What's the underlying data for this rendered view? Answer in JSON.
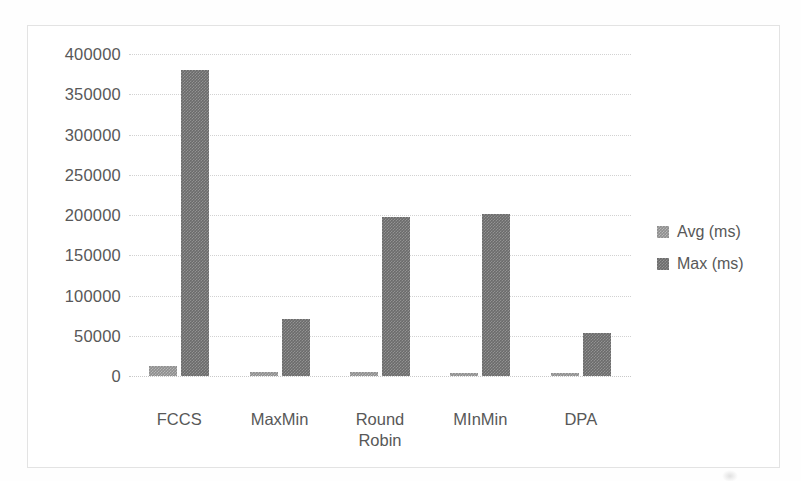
{
  "chart_data": {
    "type": "bar",
    "title": "",
    "xlabel": "",
    "ylabel": "",
    "categories": [
      "FCCS",
      "MaxMin",
      "Round\nRobin",
      "MInMin",
      "DPA"
    ],
    "series": [
      {
        "name": "Avg (ms)",
        "color": "#8e8e8e",
        "values": [
          13000,
          4500,
          5000,
          4000,
          4000
        ]
      },
      {
        "name": "Max (ms)",
        "color": "#6b6b6b",
        "values": [
          380000,
          71000,
          198000,
          201000,
          53000
        ]
      }
    ],
    "ylim": [
      0,
      400000
    ],
    "ytick_labels": [
      "400000",
      "350000",
      "300000",
      "250000",
      "200000",
      "150000",
      "100000",
      "50000",
      "0"
    ],
    "ytick_values": [
      400000,
      350000,
      300000,
      250000,
      200000,
      150000,
      100000,
      50000,
      0
    ],
    "grid": true,
    "legend_position": "right"
  },
  "legend": {
    "entries": [
      {
        "label": "Avg (ms)",
        "swatch": "avg"
      },
      {
        "label": "Max (ms)",
        "swatch": "max"
      }
    ]
  }
}
